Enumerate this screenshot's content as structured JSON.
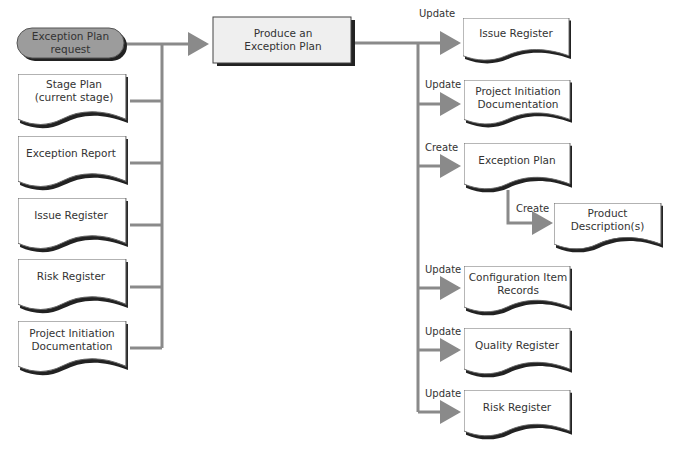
{
  "trigger": {
    "label": "Exception Plan request"
  },
  "activity": {
    "label": "Produce an Exception Plan"
  },
  "inputs": [
    {
      "label": "Stage Plan (current stage)"
    },
    {
      "label": "Exception Report"
    },
    {
      "label": "Issue Register"
    },
    {
      "label": "Risk Register"
    },
    {
      "label": "Project Initiation Documentation"
    }
  ],
  "outputs": [
    {
      "action": "Update",
      "label": "Issue Register"
    },
    {
      "action": "Update",
      "label": "Project Initiation Documentation"
    },
    {
      "action": "Create",
      "label": "Exception Plan"
    },
    {
      "action": "Update",
      "label": "Configuration Item Records"
    },
    {
      "action": "Update",
      "label": "Quality Register"
    },
    {
      "action": "Update",
      "label": "Risk Register"
    }
  ],
  "sub_output": {
    "action": "Create",
    "label": "Product Description(s)"
  },
  "colors": {
    "line": "#8a8a8a",
    "trigger_fill": "#9c9c9c",
    "activity_fill": "#efefef",
    "shadow": "#222222"
  }
}
